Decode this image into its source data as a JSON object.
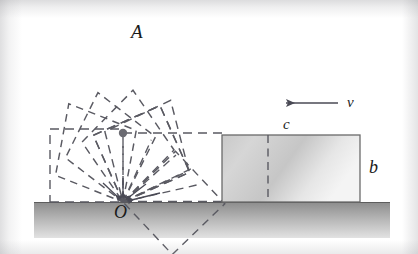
{
  "figure": {
    "kind": "physics-mechanics-diagram",
    "background_color": "#ffffff",
    "line_color": "#4a4a55",
    "ink_color": "#1a1a1a"
  },
  "labels": {
    "apex": "A",
    "pivot": "O",
    "block_height": "b",
    "block_width": "c",
    "velocity": "v"
  },
  "ground": {
    "top_y": 202,
    "bottom_y": 238,
    "left_x": 34,
    "right_x": 390,
    "fill_top": "#8f8f8f",
    "fill_bottom": "#d8d8d8"
  },
  "pivot_point": {
    "x": 123,
    "y": 202
  },
  "center_dot": {
    "x": 123,
    "y": 133,
    "radius": 4,
    "color": "#6b6b72"
  },
  "cube": {
    "side": 73,
    "positions": [
      {
        "name": "upright",
        "angle_deg": 0,
        "label": null
      },
      {
        "name": "tilt-1",
        "angle_deg": 24,
        "label": "A"
      },
      {
        "name": "tilt-2",
        "angle_deg": 44,
        "label": null
      },
      {
        "name": "tilt-3",
        "angle_deg": 62,
        "label": null
      },
      {
        "name": "tilt-4",
        "angle_deg": 80,
        "label": null
      }
    ]
  },
  "sliding_block": {
    "x": 222,
    "y": 135,
    "width": 138,
    "height": 67,
    "interior_dashed_x": 268,
    "fill_left": "#cfcfcf",
    "fill_right": "#f2f2f2",
    "edge_color": "#6a6a6a"
  },
  "velocity_arrow": {
    "tail_x": 338,
    "tip_x": 284,
    "y": 103,
    "direction": "left"
  },
  "radial_lines_from_pivot": 5,
  "dashed_baseline": {
    "from_x": 123,
    "to_x": 222,
    "y": 202
  },
  "dashed_center_line": {
    "from_x": 123,
    "to_x": 222,
    "y": 133
  }
}
